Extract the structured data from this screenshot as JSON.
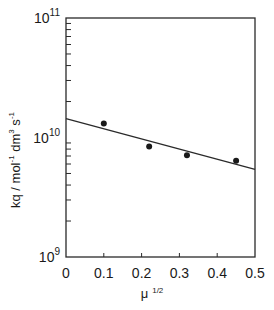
{
  "chart_data": {
    "type": "scatter",
    "title": "",
    "xlabel": "μ 1/2",
    "ylabel": "kq / mol-1 dm3 s-1",
    "x_ticks": [
      0,
      0.1,
      0.2,
      0.3,
      0.4,
      0.5
    ],
    "x_tick_labels": [
      "0",
      "0.1",
      "0.2",
      "0.3",
      "0.4",
      "0.5"
    ],
    "y_scale": "log",
    "y_ticks": [
      1000000000.0,
      10000000000.0,
      100000000000.0
    ],
    "y_tick_labels": [
      {
        "base": "10",
        "exp": "9"
      },
      {
        "base": "10",
        "exp": "10"
      },
      {
        "base": "10",
        "exp": "11"
      }
    ],
    "xlim": [
      0,
      0.5
    ],
    "ylim": [
      1000000000.0,
      100000000000.0
    ],
    "grid": false,
    "series": [
      {
        "name": "data",
        "marker": "filled-circle",
        "x": [
          0.1,
          0.22,
          0.32,
          0.45
        ],
        "y": [
          13100000000.0,
          8400000000.0,
          7100000000.0,
          6400000000.0
        ]
      },
      {
        "name": "fit",
        "type": "line",
        "x": [
          0,
          0.5
        ],
        "y": [
          14400000000.0,
          5400000000.0
        ]
      }
    ]
  },
  "labels": {
    "ylabel_kq": "kq / mol",
    "ylabel_exp1": "-1",
    "ylabel_dm": " dm",
    "ylabel_exp2": "3",
    "ylabel_s": " s",
    "ylabel_exp3": "-1",
    "xlabel_mu": "μ",
    "xlabel_exp": "1/2"
  }
}
